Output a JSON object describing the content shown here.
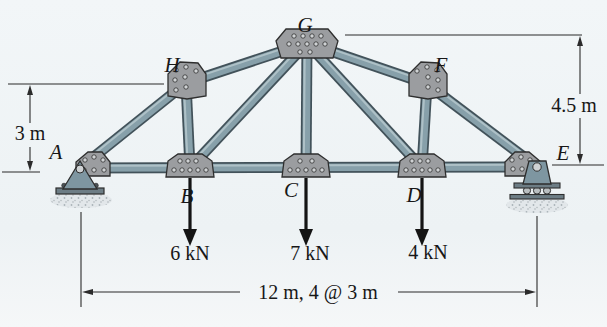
{
  "page": {
    "background": "#eff3f6"
  },
  "figure": {
    "type": "truss-diagram",
    "colors": {
      "member_fill": "#87a0aa",
      "member_outline": "#42525a",
      "member_highlight": "#b2c4ca",
      "gusset_fill": "#9b9da0",
      "gusset_outline": "#2e2e2e",
      "rivet_fill": "#cfd2d4",
      "support_fill": "#7e96a1",
      "plate_fill": "#6d7d85",
      "ground_fill": "#e2e7ea",
      "ground_dot": "#a9b3b8",
      "line_color": "#2b2b2b",
      "text_color": "#171717",
      "load_color": "#141414"
    },
    "joints": [
      {
        "id": "A",
        "x_m": 0,
        "y_m": 0,
        "support": "pin"
      },
      {
        "id": "B",
        "x_m": 3,
        "y_m": 0
      },
      {
        "id": "C",
        "x_m": 6,
        "y_m": 0
      },
      {
        "id": "D",
        "x_m": 9,
        "y_m": 0
      },
      {
        "id": "E",
        "x_m": 12,
        "y_m": 0,
        "support": "rocker"
      },
      {
        "id": "H",
        "x_m": 3,
        "y_m": 3
      },
      {
        "id": "G",
        "x_m": 6,
        "y_m": 4.5
      },
      {
        "id": "F",
        "x_m": 9,
        "y_m": 3
      }
    ],
    "members": [
      [
        "A",
        "E"
      ],
      [
        "A",
        "H"
      ],
      [
        "H",
        "G"
      ],
      [
        "G",
        "F"
      ],
      [
        "F",
        "E"
      ],
      [
        "B",
        "H"
      ],
      [
        "C",
        "G"
      ],
      [
        "D",
        "F"
      ],
      [
        "B",
        "G"
      ],
      [
        "D",
        "G"
      ]
    ],
    "loads": [
      {
        "at": "B",
        "label": "6 kN",
        "magnitude_kN": 6,
        "direction": "down"
      },
      {
        "at": "C",
        "label": "7 kN",
        "magnitude_kN": 7,
        "direction": "down"
      },
      {
        "at": "D",
        "label": "4 kN",
        "magnitude_kN": 4,
        "direction": "down"
      }
    ],
    "dimensions": {
      "left_height": {
        "label": "3 m"
      },
      "right_height": {
        "label": "4.5 m"
      },
      "bottom_span": {
        "label": "12 m, 4 @ 3 m"
      }
    }
  }
}
